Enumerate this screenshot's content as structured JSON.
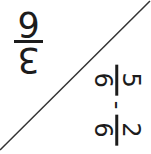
{
  "colors": {
    "background": "#ffffff",
    "text": "#1c1c1c",
    "line": "#333333"
  },
  "answer_card": {
    "fraction": {
      "numerator": "3",
      "denominator": "6"
    }
  },
  "problem_card": {
    "expression": {
      "fraction1": {
        "numerator": "5",
        "denominator": "6"
      },
      "operator": "-",
      "fraction2": {
        "numerator": "2",
        "denominator": "6"
      }
    }
  }
}
